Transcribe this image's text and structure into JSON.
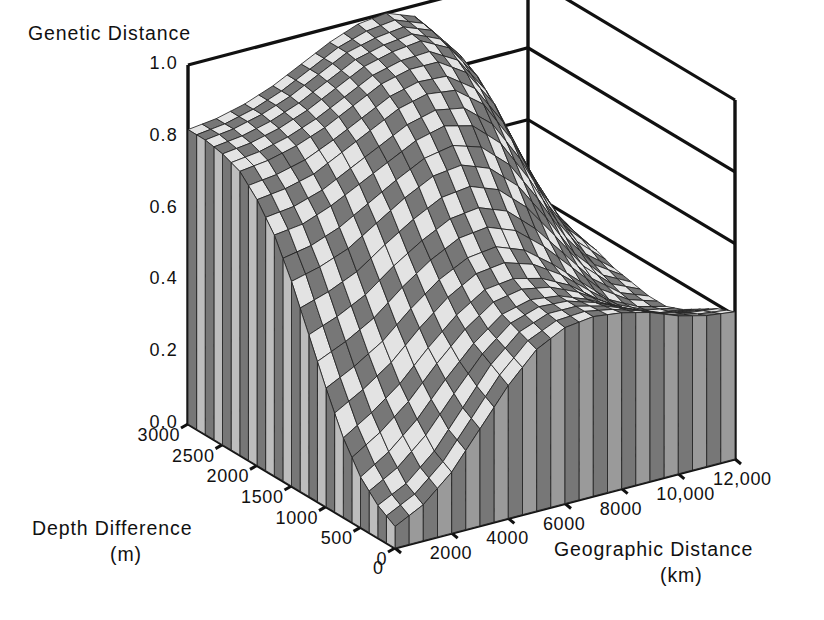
{
  "figure": {
    "type": "surface-3d",
    "background": "#ffffff",
    "ink": "#111111"
  },
  "axes": {
    "z": {
      "title": "Genetic Distance",
      "ticks": [
        "1.0",
        "0.8",
        "0.6",
        "0.4",
        "0.2",
        "0.0"
      ],
      "values": [
        1.0,
        0.8,
        0.6,
        0.4,
        0.2,
        0.0
      ],
      "range": [
        0.0,
        1.0
      ]
    },
    "y": {
      "title": "Depth Difference",
      "units": "(m)",
      "ticks": [
        "3000",
        "2500",
        "2000",
        "1500",
        "1000",
        "500",
        "0"
      ],
      "values": [
        3000,
        2500,
        2000,
        1500,
        1000,
        500,
        0
      ],
      "range": [
        0,
        3000
      ]
    },
    "x": {
      "title": "Geographic Distance",
      "units": "(km)",
      "ticks": [
        "0",
        "2000",
        "4000",
        "6000",
        "8000",
        "10,000",
        "12,000"
      ],
      "values": [
        0,
        2000,
        4000,
        6000,
        8000,
        10000,
        12000
      ],
      "range": [
        0,
        12000
      ]
    }
  },
  "chart_data": {
    "type": "surface",
    "title": "",
    "xlabel": "Geographic Distance (km)",
    "ylabel": "Depth Difference (m)",
    "zlabel": "Genetic Distance",
    "xlim": [
      0,
      12000
    ],
    "ylim": [
      0,
      3000
    ],
    "zlim": [
      0,
      1.0
    ],
    "grid": true,
    "legend": "none",
    "x": [
      0,
      1000,
      2000,
      3000,
      4000,
      5000,
      6000,
      7000,
      8000,
      9000,
      10000,
      11000,
      12000
    ],
    "y": [
      0,
      250,
      500,
      750,
      1000,
      1250,
      1500,
      1750,
      2000,
      2250,
      2500,
      2750,
      3000
    ],
    "z_rows_note": "rows indexed by y (depth, 0 -> 3000), columns by x (geographic, 0 -> 12000)",
    "z": [
      [
        0.06,
        0.1,
        0.17,
        0.27,
        0.37,
        0.45,
        0.49,
        0.5,
        0.49,
        0.47,
        0.44,
        0.42,
        0.41
      ],
      [
        0.09,
        0.13,
        0.2,
        0.3,
        0.4,
        0.47,
        0.5,
        0.5,
        0.48,
        0.45,
        0.42,
        0.4,
        0.39
      ],
      [
        0.14,
        0.19,
        0.26,
        0.35,
        0.43,
        0.49,
        0.51,
        0.5,
        0.47,
        0.43,
        0.39,
        0.37,
        0.36
      ],
      [
        0.22,
        0.27,
        0.33,
        0.41,
        0.48,
        0.53,
        0.54,
        0.52,
        0.48,
        0.42,
        0.37,
        0.34,
        0.33
      ],
      [
        0.33,
        0.37,
        0.42,
        0.49,
        0.55,
        0.59,
        0.6,
        0.57,
        0.51,
        0.44,
        0.37,
        0.33,
        0.31
      ],
      [
        0.45,
        0.48,
        0.52,
        0.58,
        0.63,
        0.67,
        0.68,
        0.65,
        0.58,
        0.49,
        0.4,
        0.34,
        0.31
      ],
      [
        0.57,
        0.59,
        0.62,
        0.67,
        0.72,
        0.76,
        0.77,
        0.74,
        0.67,
        0.56,
        0.44,
        0.36,
        0.32
      ],
      [
        0.67,
        0.68,
        0.71,
        0.75,
        0.79,
        0.83,
        0.85,
        0.83,
        0.76,
        0.64,
        0.5,
        0.39,
        0.33
      ],
      [
        0.74,
        0.75,
        0.77,
        0.81,
        0.85,
        0.89,
        0.91,
        0.9,
        0.84,
        0.72,
        0.56,
        0.43,
        0.35
      ],
      [
        0.79,
        0.8,
        0.82,
        0.85,
        0.89,
        0.93,
        0.95,
        0.95,
        0.9,
        0.79,
        0.62,
        0.46,
        0.36
      ],
      [
        0.81,
        0.82,
        0.84,
        0.87,
        0.91,
        0.95,
        0.97,
        0.98,
        0.94,
        0.84,
        0.66,
        0.48,
        0.37
      ],
      [
        0.82,
        0.83,
        0.85,
        0.88,
        0.92,
        0.96,
        0.98,
        0.99,
        0.96,
        0.87,
        0.69,
        0.49,
        0.37
      ],
      [
        0.82,
        0.83,
        0.85,
        0.88,
        0.92,
        0.96,
        0.99,
        1.0,
        0.97,
        0.88,
        0.7,
        0.5,
        0.38
      ]
    ],
    "features": [
      {
        "name": "back-ridge-peak",
        "x": 7000,
        "y": 3000,
        "z": 1.0
      },
      {
        "name": "front-corner-trough",
        "x": 0,
        "y": 0,
        "z": 0.06
      },
      {
        "name": "right-lobe-crest",
        "x": 11500,
        "y": 900,
        "z": 0.45
      },
      {
        "name": "right-cliff-edge",
        "x": 9500,
        "y": 2600,
        "z": 0.8
      }
    ]
  },
  "style": {
    "patch_light": "#e3e3e3",
    "patch_dark": "#777777",
    "mesh_line": "#222222",
    "frame_line": "#111111"
  }
}
